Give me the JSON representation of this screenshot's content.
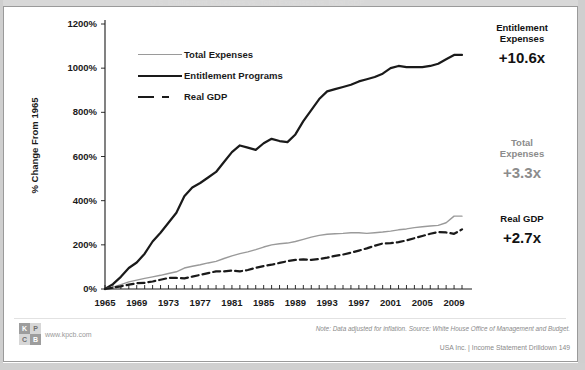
{
  "slide": {
    "ghost_title": "U.S. Entitlement Expenses vs. Total Expenses vs. Real GDP",
    "note": "Note: Data adjusted for inflation. Source: White House Office of Management and Budget.",
    "page_footer": "USA Inc. | Income Statement Drilldown   149",
    "logo": {
      "cell_1": "K",
      "cell_2": "P",
      "cell_3": "C",
      "cell_4": "B",
      "url": "www.kpcb.com"
    }
  },
  "annotations": [
    {
      "name": "Entitlement\nExpenses",
      "name_line1": "Entitlement",
      "name_line2": "Expenses",
      "value": "+10.6x",
      "color": "#121212",
      "tone": "dark"
    },
    {
      "name_line1": "Total",
      "name_line2": "Expenses",
      "value": "+3.3x",
      "color": "#8c8c8c",
      "tone": "gray"
    },
    {
      "name_line1": "Real GDP",
      "name_line2": "",
      "value": "+2.7x",
      "color": "#121212",
      "tone": "dark"
    }
  ],
  "legend": [
    {
      "label": "Total Expenses",
      "style": "thin-gray",
      "color": "#9a9a9a"
    },
    {
      "label": "Entitlement Programs",
      "style": "thick-black",
      "color": "#1a1a1a"
    },
    {
      "label": "Real GDP",
      "style": "dashed-black",
      "color": "#1a1a1a"
    }
  ],
  "chart_data": {
    "type": "line",
    "title": "",
    "xlabel": "",
    "ylabel": "% Change From 1965",
    "ylim": [
      0,
      1200
    ],
    "yticks": [
      0,
      200,
      400,
      600,
      800,
      1000,
      1200
    ],
    "ytick_labels": [
      "0%",
      "200%",
      "400%",
      "600%",
      "800%",
      "1000%",
      "1200%"
    ],
    "xlim": [
      1965,
      2010
    ],
    "xticks": [
      1965,
      1969,
      1973,
      1977,
      1981,
      1985,
      1989,
      1993,
      1997,
      2001,
      2005,
      2009
    ],
    "xtick_labels": [
      "1965",
      "1969",
      "1973",
      "1977",
      "1981",
      "1985",
      "1989",
      "1993",
      "1997",
      "2001",
      "2005",
      "2009"
    ],
    "minor_xticks_every": 1,
    "grid": false,
    "legend_position": "upper-left-inside",
    "x": [
      1965,
      1966,
      1967,
      1968,
      1969,
      1970,
      1971,
      1972,
      1973,
      1974,
      1975,
      1976,
      1977,
      1978,
      1979,
      1980,
      1981,
      1982,
      1983,
      1984,
      1985,
      1986,
      1987,
      1988,
      1989,
      1990,
      1991,
      1992,
      1993,
      1994,
      1995,
      1996,
      1997,
      1998,
      1999,
      2000,
      2001,
      2002,
      2003,
      2004,
      2005,
      2006,
      2007,
      2008,
      2009,
      2010
    ],
    "series": [
      {
        "name": "Entitlement Programs",
        "color": "#1a1a1a",
        "width": 2.2,
        "dash": "solid",
        "end_label": "+10.6x",
        "values": [
          0,
          22,
          55,
          95,
          120,
          160,
          215,
          255,
          300,
          345,
          420,
          460,
          480,
          505,
          530,
          575,
          620,
          650,
          640,
          630,
          660,
          680,
          670,
          665,
          700,
          760,
          810,
          860,
          895,
          905,
          915,
          925,
          940,
          950,
          960,
          975,
          1000,
          1010,
          1005,
          1005,
          1005,
          1010,
          1020,
          1040,
          1060,
          1060
        ]
      },
      {
        "name": "Total Expenses",
        "color": "#9a9a9a",
        "width": 1.4,
        "dash": "solid",
        "end_label": "+3.3x",
        "values": [
          0,
          8,
          20,
          32,
          40,
          48,
          55,
          62,
          70,
          78,
          95,
          103,
          110,
          118,
          125,
          138,
          150,
          160,
          168,
          178,
          190,
          200,
          205,
          208,
          215,
          225,
          235,
          243,
          248,
          250,
          252,
          255,
          255,
          252,
          255,
          258,
          262,
          268,
          272,
          278,
          282,
          285,
          288,
          300,
          330,
          330
        ]
      },
      {
        "name": "Real GDP",
        "color": "#1a1a1a",
        "width": 2.2,
        "dash": "dashed",
        "end_label": "+2.7x",
        "values": [
          0,
          6,
          12,
          20,
          26,
          28,
          34,
          42,
          50,
          50,
          48,
          56,
          64,
          72,
          80,
          80,
          84,
          80,
          86,
          96,
          104,
          110,
          118,
          126,
          132,
          134,
          132,
          136,
          142,
          150,
          156,
          164,
          174,
          184,
          196,
          206,
          208,
          212,
          220,
          230,
          240,
          250,
          258,
          256,
          250,
          270
        ]
      }
    ]
  }
}
